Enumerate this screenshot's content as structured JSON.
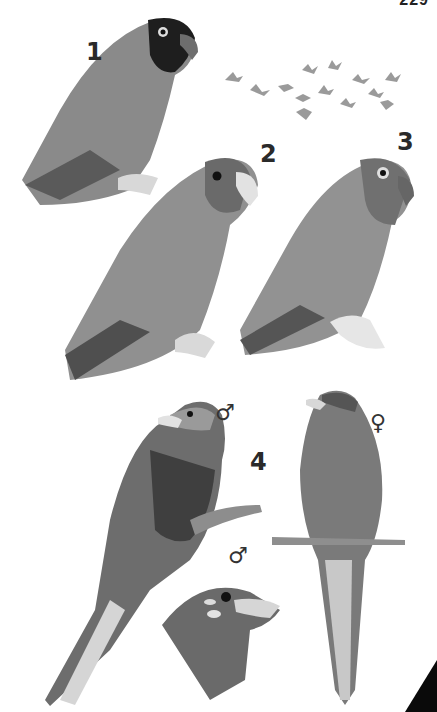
{
  "page": {
    "number": "229"
  },
  "plate": {
    "labels": [
      {
        "id": "1",
        "text": "1"
      },
      {
        "id": "2",
        "text": "2"
      },
      {
        "id": "3",
        "text": "3"
      },
      {
        "id": "4",
        "text": "4"
      }
    ],
    "sex_symbols": {
      "male_main": "♂",
      "female": "♀",
      "male_head": "♂"
    },
    "figures": [
      {
        "ref": "1",
        "description": "lovebird with dark head, perched"
      },
      {
        "ref": "flock",
        "description": "flock of small birds in flight"
      },
      {
        "ref": "2",
        "description": "lovebird with pale bill, perched"
      },
      {
        "ref": "3",
        "description": "lovebird with white eye-ring, perched"
      },
      {
        "ref": "4",
        "description": "long-tailed bird, male perched on branch"
      },
      {
        "ref": "4",
        "description": "long-tailed bird, female perched on twig"
      },
      {
        "ref": "4",
        "description": "male head detail"
      }
    ]
  }
}
